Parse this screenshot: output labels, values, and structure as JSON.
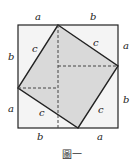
{
  "figure": {
    "caption": "圖一",
    "labels": {
      "top_a": "a",
      "top_b": "b",
      "right_a": "a",
      "right_b": "b",
      "bottom_b": "b",
      "bottom_a": "a",
      "left_b": "b",
      "left_a": "a",
      "c_top_left": "c",
      "c_top_right": "c",
      "c_bottom_right": "c",
      "c_bottom_left": "c"
    },
    "colors": {
      "inner_square": "#d9d9d9",
      "outer_fill": "#f2f2f2",
      "stroke": "#222222"
    }
  }
}
